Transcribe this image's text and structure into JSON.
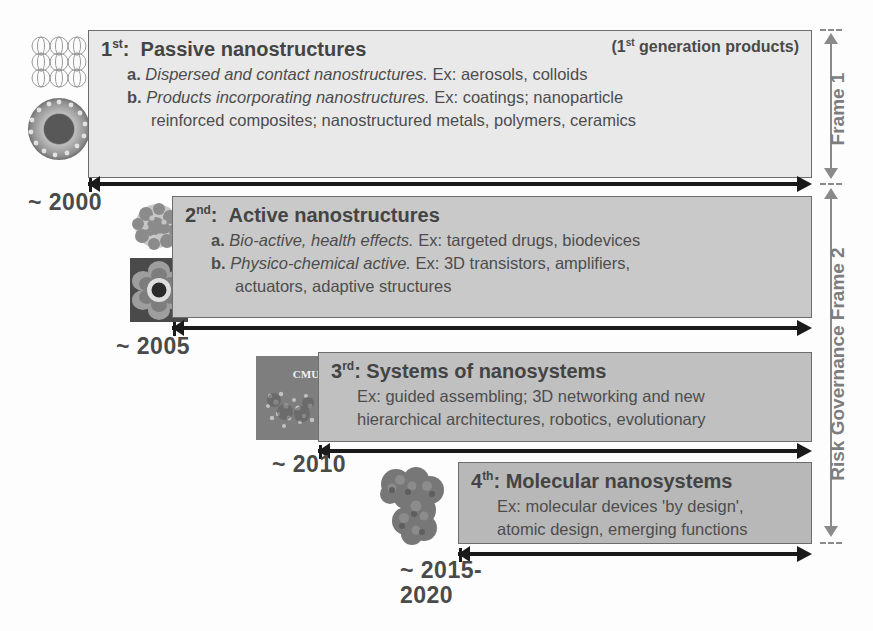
{
  "diagram": {
    "right_axis": {
      "frame1_label": "Frame 1",
      "frame2_label": "Risk Governance Frame 2"
    }
  },
  "generations": [
    {
      "ordinal": "1",
      "ordinal_suffix": "st",
      "heading": "Passive nanostructures",
      "note": "generation products)",
      "note_prefix": "(1",
      "note_sup": "st",
      "lines": [
        {
          "bullet": "a.",
          "em": "Dispersed and contact nanostructures.",
          "rest": "Ex:  aerosols, colloids",
          "indent": 1
        },
        {
          "bullet": "b.",
          "em": "Products incorporating nanostructures.",
          "rest": "Ex: coatings; nanoparticle",
          "indent": 1
        },
        {
          "bullet": "",
          "em": "",
          "rest": "reinforced composites; nanostructured metals, polymers, ceramics",
          "indent": 2
        }
      ],
      "year": "~ 2000",
      "bg_color": "#e9e9e9"
    },
    {
      "ordinal": "2",
      "ordinal_suffix": "nd",
      "heading": "Active nanostructures",
      "note": "",
      "note_prefix": "",
      "note_sup": "",
      "lines": [
        {
          "bullet": "a.",
          "em": "Bio-active, health effects.",
          "rest": "Ex: targeted drugs, biodevices",
          "indent": 1
        },
        {
          "bullet": "b.",
          "em": "Physico-chemical active.",
          "rest": "Ex: 3D transistors, amplifiers,",
          "indent": 1
        },
        {
          "bullet": "",
          "em": "",
          "rest": "actuators, adaptive structures",
          "indent": 2
        }
      ],
      "year": "~ 2005",
      "bg_color": "#c9c9c9"
    },
    {
      "ordinal": "3",
      "ordinal_suffix": "rd",
      "heading": "Systems of nanosystems",
      "note": "",
      "note_prefix": "",
      "note_sup": "",
      "lines": [
        {
          "bullet": "",
          "em": "",
          "rest": "Ex: guided assembling; 3D networking and new",
          "indent": 1
        },
        {
          "bullet": "",
          "em": "",
          "rest": "hierarchical architectures, robotics, evolutionary",
          "indent": 1
        }
      ],
      "year": "~ 2010",
      "bg_color": "#c0c0c0"
    },
    {
      "ordinal": "4",
      "ordinal_suffix": "th",
      "heading": "Molecular nanosystems",
      "note": "",
      "note_prefix": "",
      "note_sup": "",
      "lines": [
        {
          "bullet": "",
          "em": "",
          "rest": "Ex: molecular devices 'by design',",
          "indent": 1
        },
        {
          "bullet": "",
          "em": "",
          "rest": "atomic design, emerging functions",
          "indent": 1
        }
      ],
      "year": "~ 2015-\n2020",
      "bg_color": "#b8b8b8"
    }
  ],
  "thumbnails": [
    {
      "name": "crystal-lattice-spheres",
      "caption": ""
    },
    {
      "name": "core-shell-nanoparticle",
      "caption": ""
    },
    {
      "name": "protein-cluster",
      "caption": ""
    },
    {
      "name": "nanoflower-micrograph",
      "caption": ""
    },
    {
      "name": "cmu-micrograph",
      "caption": "CMU"
    },
    {
      "name": "molecular-cluster",
      "caption": ""
    }
  ],
  "colors": {
    "arrow": "#1a1a1a",
    "text": "#4a4a4a",
    "frame_axis": "#8a8a8a",
    "box_border": "#6d6d6d"
  }
}
